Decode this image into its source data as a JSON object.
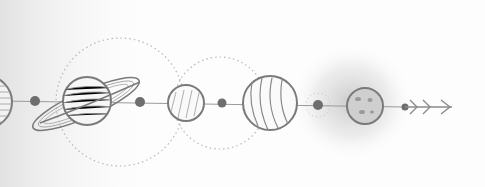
{
  "illustration": {
    "subject": "hand-drawn solar system sketch",
    "colors": {
      "background": "#fdfdfd",
      "stroke": "#7a7a7a",
      "dot": "#6e6e6e",
      "orbit": "#b8b8b8",
      "left_fade": "#e4e4e4",
      "glow": "#c8c8c8"
    },
    "axis_y": 103,
    "planets": [
      {
        "name": "sun-edge",
        "cx": -14,
        "cy": 102,
        "r": 26
      },
      {
        "name": "saturn",
        "cx": 87,
        "cy": 101,
        "r": 24
      },
      {
        "name": "small-planet",
        "cx": 186,
        "cy": 103,
        "r": 18
      },
      {
        "name": "jupiter",
        "cx": 270,
        "cy": 103,
        "r": 27
      },
      {
        "name": "moon-planet",
        "cx": 365,
        "cy": 106,
        "r": 18
      }
    ],
    "dots": [
      {
        "cx": 35,
        "cy": 101,
        "r": 5
      },
      {
        "cx": 140,
        "cy": 102,
        "r": 5
      },
      {
        "cx": 222,
        "cy": 103,
        "r": 4.5
      },
      {
        "cx": 318,
        "cy": 105,
        "r": 5
      },
      {
        "cx": 405,
        "cy": 107,
        "r": 3.5
      }
    ],
    "orbits": [
      {
        "cx": 120,
        "cy": 102,
        "r": 64
      },
      {
        "cx": 220,
        "cy": 103,
        "r": 46
      }
    ],
    "arrow": {
      "x1": 405,
      "x2": 452,
      "y": 107,
      "chevrons": [
        412,
        425,
        443
      ]
    }
  }
}
